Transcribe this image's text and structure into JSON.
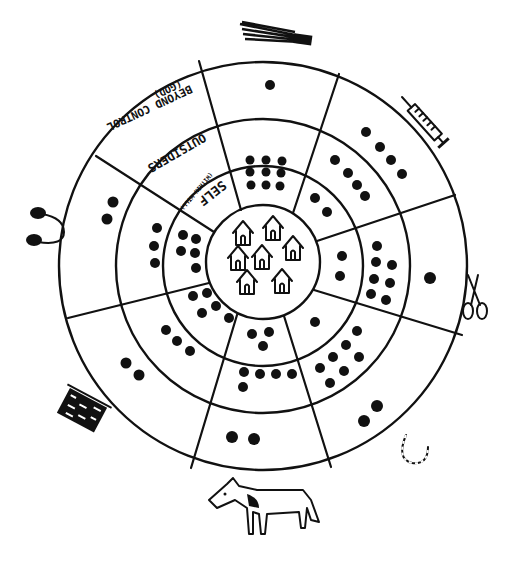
{
  "diagram": {
    "type": "concentric circle social diagram (hand-drawn)",
    "rings": [
      {
        "id": "center",
        "content": "houses",
        "house_count": 7
      },
      {
        "id": "self",
        "label": "SELF",
        "sublabel": "(WITHIN WILL)"
      },
      {
        "id": "outsiders",
        "label": "OUTSIDERS"
      },
      {
        "id": "beyond",
        "label": "BEYOND CONTROL",
        "sublabel": "(GOD)"
      }
    ],
    "sectors": [
      {
        "id": "top",
        "icon": "broom-icon",
        "dots": {
          "self": 9,
          "outsiders": 0,
          "beyond": 1
        }
      },
      {
        "id": "top-right",
        "icon": "syringe-icon",
        "dots": {
          "self": 2,
          "outsiders": 4,
          "beyond": 4
        }
      },
      {
        "id": "right",
        "icon": "scissors-icon",
        "dots": {
          "self": 2,
          "outsiders": 8,
          "beyond": 1
        }
      },
      {
        "id": "bottom-right",
        "icon": "horseshoe-icon",
        "dots": {
          "self": 1,
          "outsiders": 7,
          "beyond": 2
        }
      },
      {
        "id": "bottom",
        "icon": "horse-icon",
        "dots": {
          "self": 3,
          "outsiders": 5,
          "beyond": 2
        }
      },
      {
        "id": "bottom-left",
        "icon": "basket-icon",
        "dots": {
          "self": 5,
          "outsiders": 3,
          "beyond": 2
        }
      },
      {
        "id": "left",
        "icon": "stethoscope-icon",
        "dots": {
          "self": 5,
          "outsiders": 3,
          "beyond": 2
        }
      },
      {
        "id": "top-left",
        "icon": "",
        "dots": {
          "self": 0,
          "outsiders": 0,
          "beyond": 0
        },
        "holds_labels": true
      }
    ]
  },
  "labels": {
    "beyond": "BEYOND CONTROL",
    "beyond_sub": "(GOD)",
    "outsiders": "OUTSIDERS",
    "self": "SELF",
    "self_sub": "(WITHIN WILL)"
  },
  "colors": {
    "ink": "#111111",
    "paper": "#ffffff"
  }
}
